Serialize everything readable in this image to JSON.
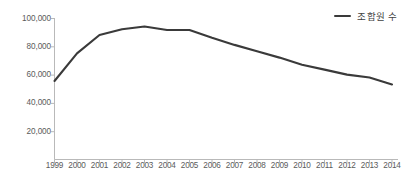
{
  "chart_data": {
    "type": "line",
    "title": "",
    "xlabel": "",
    "ylabel": "",
    "categories": [
      "1999",
      "2000",
      "2001",
      "2002",
      "2003",
      "2004",
      "2005",
      "2006",
      "2007",
      "2008",
      "2009",
      "2010",
      "2011",
      "2012",
      "2013",
      "2014"
    ],
    "series": [
      {
        "name": "조합원 수",
        "color": "#3a3a3a",
        "values": [
          55500,
          75000,
          88000,
          92000,
          94000,
          91500,
          91500,
          86000,
          81000,
          76500,
          72000,
          67000,
          63500,
          60000,
          58000,
          53000
        ]
      }
    ],
    "ylim": [
      0,
      100000
    ],
    "yticks": [
      20000,
      40000,
      60000,
      80000,
      100000
    ],
    "ytick_labels": [
      "20,000",
      "40,000",
      "60,000",
      "80,000",
      "100,000"
    ],
    "xtick_labels": [
      "1999",
      "2000",
      "2001",
      "2002",
      "2003",
      "2004",
      "2005",
      "2006",
      "2007",
      "2008",
      "2009",
      "2010",
      "2011",
      "2012",
      "2013",
      "2014"
    ],
    "grid": false,
    "legend_position": "top-right",
    "axis_color": "#b4b4b4"
  },
  "legend": {
    "entries": [
      {
        "label": "조합원 수",
        "swatch_name": "legend-line-swatch"
      }
    ]
  }
}
